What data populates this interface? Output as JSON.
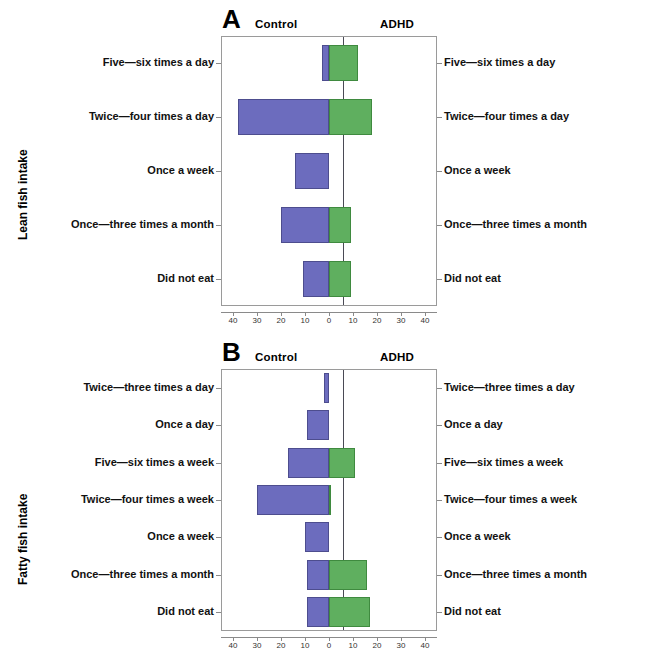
{
  "figure": {
    "side_title_a": "Lean fish intake",
    "side_title_b": "Fatty fish intake"
  },
  "panels": [
    {
      "id": "A",
      "letter": "A",
      "group_left": "Control",
      "group_right": "ADHD",
      "side_title": "Lean fish intake"
    },
    {
      "id": "B",
      "letter": "B",
      "group_left": "Control",
      "group_right": "ADHD",
      "side_title": "Fatty fish intake"
    }
  ],
  "colors": {
    "control": "#6c6cbe",
    "adhd": "#5faf5f",
    "control_edge": "#4d4d8e",
    "adhd_edge": "#3f8a3f",
    "frame": "#9a9a9a",
    "zeroline": "#4a4a55"
  },
  "axis": {
    "ticks": [
      "40",
      "30",
      "20",
      "10",
      "0",
      "10",
      "20",
      "30",
      "40"
    ],
    "tick_values": [
      -40,
      -30,
      -20,
      -10,
      0,
      10,
      20,
      30,
      40
    ],
    "xmin": -45,
    "xmax": 45,
    "xlabel": ""
  },
  "chart_data": [
    {
      "type": "bar",
      "title": "A",
      "orientation": "horizontal",
      "style": "back-to-back pyramid",
      "ylabel": "Lean fish intake",
      "xlabel": "",
      "xlim": [
        -45,
        45
      ],
      "grid": false,
      "legend": [
        "Control",
        "ADHD"
      ],
      "legend_position": "top (column headers)",
      "categories": [
        "Five—six times a day",
        "Twice—four times a day",
        "Once a week",
        "Once—three times a month",
        "Did not eat"
      ],
      "series": [
        {
          "name": "Control",
          "side": "left",
          "values": [
            3,
            38,
            14,
            20,
            11
          ]
        },
        {
          "name": "ADHD",
          "side": "right",
          "values": [
            12,
            18,
            0,
            9,
            9
          ]
        }
      ]
    },
    {
      "type": "bar",
      "title": "B",
      "orientation": "horizontal",
      "style": "back-to-back pyramid",
      "ylabel": "Fatty fish intake",
      "xlabel": "",
      "xlim": [
        -45,
        45
      ],
      "grid": false,
      "legend": [
        "Control",
        "ADHD"
      ],
      "legend_position": "top (column headers)",
      "categories": [
        "Twice—three times a day",
        "Once a day",
        "Five—six times a week",
        "Twice—four times a week",
        "Once a week",
        "Once—three times a month",
        "Did not eat"
      ],
      "series": [
        {
          "name": "Control",
          "side": "left",
          "values": [
            2,
            9,
            17,
            30,
            10,
            9,
            9
          ]
        },
        {
          "name": "ADHD",
          "side": "right",
          "values": [
            0,
            0,
            11,
            1,
            0,
            16,
            17
          ]
        }
      ]
    }
  ]
}
